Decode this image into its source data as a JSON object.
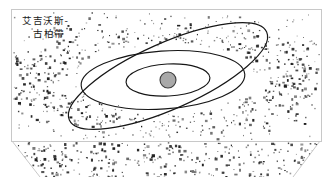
{
  "figure": {
    "kind": "astronomy-diagram",
    "title_line1": "艾吉沃斯-",
    "title_line2": "古柏帶",
    "caption_full": "艾吉沃斯-古柏帶",
    "background_color": "#ffffff",
    "frame_color": "#c8c8c8",
    "dot_color": "#1a1a1a",
    "orbit_color": "#161616",
    "sun_fill": "#a9a9a9",
    "sun_stroke": "#3d3d3d"
  },
  "frame": {
    "x": 11,
    "y": 9,
    "width": 310,
    "height": 132,
    "stroke_width": 1
  },
  "callout": {
    "name": "zoom-funnel",
    "left_line": {
      "x1": 12,
      "y1": 141,
      "x2": 40,
      "y2": 177
    },
    "right_line": {
      "x1": 320,
      "y1": 141,
      "x2": 293,
      "y2": 177
    }
  },
  "solar_system": {
    "sun": {
      "cx": 168,
      "cy": 80,
      "r": 8
    },
    "orbits": [
      {
        "name": "inner-orbit",
        "cx": 168,
        "cy": 80,
        "rx": 42,
        "ry": 16,
        "rotate": -3
      },
      {
        "name": "outer-orbit",
        "cx": 163,
        "cy": 80,
        "rx": 82,
        "ry": 29,
        "rotate": -4
      },
      {
        "name": "pluto-inclined-orbit",
        "cx": 168,
        "cy": 76,
        "rx": 108,
        "ry": 33,
        "rotate": -24
      }
    ]
  },
  "chart_data": {
    "type": "scatter",
    "xlabel": "",
    "ylabel": "",
    "legend": [],
    "annotations": [
      "艾吉沃斯-",
      "古柏帶"
    ],
    "series": [
      {
        "name": "kuiper-belt-objects-inner-frame",
        "count": 760,
        "description": "dense toroidal band of small bodies, densest at left and right flanks"
      },
      {
        "name": "kuiper-belt-objects-callout",
        "count": 330,
        "description": "magnified sample of belt objects shown in the lower funnel"
      }
    ]
  }
}
